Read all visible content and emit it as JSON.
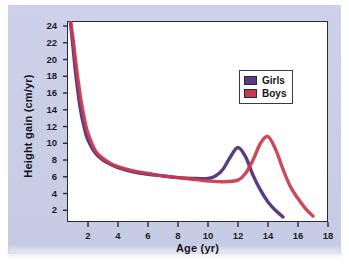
{
  "chart_data": {
    "type": "line",
    "title": "",
    "xlabel": "Age (yr)",
    "ylabel": "Height gain (cm/yr)",
    "xlim": [
      0.6,
      18
    ],
    "ylim": [
      0.6,
      24.6
    ],
    "xticks": [
      2,
      4,
      6,
      8,
      10,
      12,
      14,
      16,
      18
    ],
    "yticks": [
      2,
      4,
      6,
      8,
      10,
      12,
      14,
      16,
      18,
      20,
      22,
      24
    ],
    "grid": false,
    "legend_position": "upper-right",
    "series": [
      {
        "name": "Girls",
        "color": "#5b3a86",
        "x": [
          0.8,
          1.0,
          1.2,
          1.5,
          1.8,
          2.0,
          2.5,
          3.0,
          3.5,
          4.0,
          5.0,
          6.0,
          7.0,
          8.0,
          9.0,
          10.0,
          10.5,
          11.0,
          11.5,
          12.0,
          12.5,
          13.0,
          13.5,
          14.0,
          14.5,
          15.0
        ],
        "y": [
          25.0,
          21.5,
          18.0,
          14.0,
          11.5,
          10.4,
          8.8,
          8.0,
          7.5,
          7.1,
          6.6,
          6.3,
          6.1,
          5.9,
          5.8,
          5.8,
          6.1,
          6.9,
          8.4,
          9.5,
          8.4,
          6.2,
          4.4,
          3.0,
          2.0,
          1.2
        ]
      },
      {
        "name": "Boys",
        "color": "#c93a4c",
        "x": [
          0.8,
          1.0,
          1.2,
          1.5,
          1.8,
          2.0,
          2.5,
          3.0,
          3.5,
          4.0,
          5.0,
          6.0,
          7.0,
          8.0,
          9.0,
          10.0,
          11.0,
          12.0,
          12.5,
          13.0,
          13.5,
          14.0,
          14.5,
          15.0,
          15.5,
          16.0,
          16.5,
          17.0
        ],
        "y": [
          25.0,
          22.5,
          19.5,
          15.5,
          12.6,
          11.2,
          9.1,
          8.2,
          7.6,
          7.2,
          6.7,
          6.4,
          6.1,
          5.9,
          5.7,
          5.5,
          5.4,
          5.6,
          6.4,
          8.0,
          10.0,
          10.8,
          9.3,
          6.9,
          4.8,
          3.4,
          2.2,
          1.3
        ]
      }
    ],
    "annotations": {
      "girls_peak_age": 12.0,
      "girls_peak_value": 9.5,
      "boys_peak_age": 14.0,
      "boys_peak_value": 10.8
    }
  },
  "legend": {
    "items": [
      {
        "label": "Girls",
        "color": "#5b3a86"
      },
      {
        "label": "Boys",
        "color": "#c93a4c"
      }
    ]
  },
  "axes": {
    "x_title": "Age (yr)",
    "y_title": "Height gain (cm/yr)",
    "xticks": [
      "2",
      "4",
      "6",
      "8",
      "10",
      "12",
      "14",
      "16",
      "18"
    ],
    "yticks": [
      "24",
      "22",
      "20",
      "18",
      "16",
      "14",
      "12",
      "10",
      "8",
      "6",
      "4",
      "2"
    ]
  },
  "colors": {
    "girls": "#5b3a86",
    "boys": "#c93a4c",
    "panel": "#ccd0e8",
    "plot_background": "#ffffff",
    "axis": "#2b2b38"
  }
}
